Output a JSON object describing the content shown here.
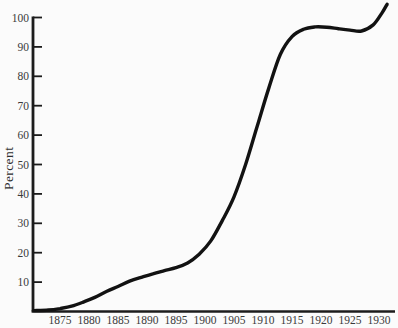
{
  "figure": {
    "background": "#fbfbfb",
    "axis_color": "#1c1c1c",
    "curve_color": "#121212",
    "tick_label_color": "#3a3a3a"
  },
  "chart_data": {
    "type": "line",
    "title": "",
    "xlabel": "",
    "ylabel": "Percent",
    "grid": false,
    "legend": null,
    "ylim": [
      0,
      100
    ],
    "xlim": [
      1870.3,
      1932.8
    ],
    "x_ticks": [
      1875,
      1880,
      1885,
      1890,
      1895,
      1900,
      1905,
      1910,
      1915,
      1920,
      1925,
      1930
    ],
    "y_ticks": [
      10,
      20,
      30,
      40,
      50,
      60,
      70,
      80,
      90,
      100
    ],
    "series": [
      {
        "name": "percent-curve",
        "x": [
          1870.5,
          1873,
          1875,
          1877,
          1879,
          1881,
          1883,
          1885,
          1887,
          1889,
          1891,
          1893,
          1895,
          1897,
          1899,
          1901,
          1903,
          1905,
          1907,
          1909,
          1911,
          1913,
          1915,
          1917,
          1919,
          1921,
          1923,
          1925,
          1927,
          1929,
          1930.5,
          1931.4
        ],
        "y": [
          0.3,
          0.5,
          1,
          1.8,
          3.2,
          4.8,
          6.8,
          8.5,
          10.3,
          11.6,
          12.8,
          13.9,
          14.9,
          16.5,
          19.5,
          24,
          31,
          39,
          50,
          63,
          76,
          87.5,
          93.5,
          96,
          96.8,
          96.7,
          96.2,
          95.7,
          95.4,
          97.5,
          101.5,
          104.5
        ]
      }
    ]
  }
}
